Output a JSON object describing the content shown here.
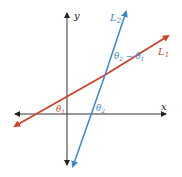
{
  "diagram": {
    "axes": {
      "x_label": "x",
      "y_label": "y",
      "color": "#333333"
    },
    "lines": [
      {
        "id": "L1",
        "label": "L",
        "subscript": "1",
        "color": "#d2402a"
      },
      {
        "id": "L2",
        "label": "L",
        "subscript": "2",
        "color": "#3a86d0"
      }
    ],
    "angles": [
      {
        "id": "theta1",
        "symbol": "θ",
        "subscript": "1",
        "color": "#d2402a"
      },
      {
        "id": "theta2",
        "symbol": "θ",
        "subscript": "2",
        "color": "#3a86d0"
      },
      {
        "id": "theta2_minus_theta1",
        "text_a": "θ",
        "sub_a": "2",
        "minus": " − ",
        "text_b": "θ",
        "sub_b": "1",
        "color": "#3a86d0"
      }
    ]
  }
}
